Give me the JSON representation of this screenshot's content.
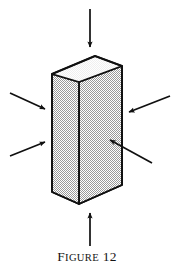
{
  "figure": {
    "caption": {
      "full_text": "FIGURE 12",
      "label_first_letter": "F",
      "label_rest": "IGURE",
      "number": "12"
    },
    "object": {
      "name": "rectangular-prism",
      "description": "isometric tall rectangular block under compression",
      "faces": {
        "top": {
          "name": "top-face",
          "fill": "#fbfbfb"
        },
        "left": {
          "name": "left-side-face",
          "fill": "#d8d8d8"
        },
        "right": {
          "name": "right-front-face",
          "fill": "#dcdcdc"
        }
      },
      "outline_color": "#101010"
    },
    "arrows": [
      {
        "id": "top",
        "name": "arrow-top",
        "direction": "down",
        "label": ""
      },
      {
        "id": "bottom",
        "name": "arrow-bottom",
        "direction": "up",
        "label": ""
      },
      {
        "id": "left-upper",
        "name": "arrow-left-upper",
        "direction": "down-right",
        "label": ""
      },
      {
        "id": "left-lower",
        "name": "arrow-left-lower",
        "direction": "up-right",
        "label": ""
      },
      {
        "id": "right-upper",
        "name": "arrow-right-upper",
        "direction": "down-left",
        "label": ""
      },
      {
        "id": "right-lower",
        "name": "arrow-right-lower",
        "direction": "up-left",
        "label": ""
      }
    ],
    "colors": {
      "ink": "#101010",
      "paper": "#ffffff",
      "shade_light": "#fbfbfb",
      "shade_mid": "#dcdcdc"
    }
  }
}
